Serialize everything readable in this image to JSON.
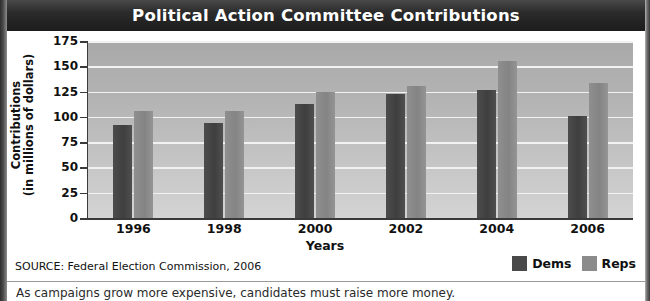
{
  "figure": {
    "title": "Political Action Committee Contributions",
    "source": "SOURCE: Federal Election Commission, 2006",
    "caption": "As campaigns grow more expensive, candidates must raise more money.",
    "colors": {
      "banner": "#1c1c1c",
      "plot_background": "#bdbdbd",
      "gridline": "#f2f2f2",
      "dems": "#494949",
      "reps": "#8b8b8b"
    }
  },
  "chart_data": {
    "type": "bar",
    "title": "Political Action Committee Contributions",
    "xlabel": "Years",
    "ylabel": "Contributions (in millions of dollars)",
    "ylabel_line1": "Contributions",
    "ylabel_line2": "(in millions of dollars)",
    "categories": [
      "1996",
      "1998",
      "2000",
      "2002",
      "2004",
      "2006"
    ],
    "ylim": [
      0,
      175
    ],
    "yticks": [
      175,
      150,
      125,
      100,
      75,
      50,
      25,
      0
    ],
    "grid": true,
    "legend_position": "bottom-right",
    "series": [
      {
        "name": "Dems",
        "color": "#494949",
        "values": [
          92,
          94,
          113,
          123,
          127,
          101
        ]
      },
      {
        "name": "Reps",
        "color": "#8b8b8b",
        "values": [
          106,
          106,
          125,
          131,
          155,
          133
        ]
      }
    ]
  },
  "legend": {
    "items": [
      {
        "label": "Dems"
      },
      {
        "label": "Reps"
      }
    ]
  }
}
